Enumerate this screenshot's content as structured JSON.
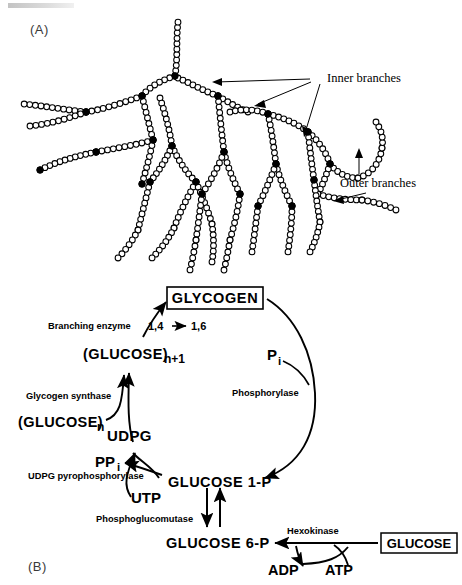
{
  "figure": {
    "panels": [
      {
        "id": "A",
        "label": "(A)"
      },
      {
        "id": "B",
        "label": "(B)"
      }
    ]
  },
  "panel_a": {
    "label": "(A)",
    "title": "Branched glycogen molecule structure",
    "annotations": [
      {
        "name": "inner-branches",
        "text": "Inner branches"
      },
      {
        "name": "outer-branches",
        "text": "Outer branches"
      }
    ],
    "legend": {
      "open_circle_meaning": "glucose residue (1,4 linked)",
      "filled_circle_meaning": "branch point (1,6 linkage)"
    }
  },
  "panel_b": {
    "label": "(B)",
    "title": "Glycogen synthesis and degradation pathway",
    "nodes": {
      "glycogen": "GLYCOGEN",
      "glucose_n_plus_1": "(GLUCOSE)",
      "glucose_n_plus_1_sub": "n+1",
      "glucose_n": "(GLUCOSE)",
      "glucose_n_sub": "n",
      "udpg": "UDPG",
      "ppi": "PP",
      "ppi_sub": "i",
      "utp": "UTP",
      "pi": "P",
      "pi_sub": "i",
      "glucose_1p": "GLUCOSE 1-P",
      "glucose_6p": "GLUCOSE 6-P",
      "glucose": "GLUCOSE",
      "adp": "ADP",
      "atp": "ATP"
    },
    "enzymes": {
      "branching_enzyme": "Branching  enzyme",
      "linkage_conversion": "1,4",
      "linkage_conversion_2": "1,6",
      "glycogen_synthase": "Glycogen  synthase",
      "udpg_pyrophosphorylase": "UDPG  pyrophosphorylase",
      "phosphoglucomutase": "Phosphoglucomutase",
      "phosphorylase": "Phosphorylase",
      "hexokinase": "Hexokinase"
    }
  },
  "colors": {
    "ink": "#000000",
    "paper": "#ffffff",
    "panel_label": "#3a3a3a"
  }
}
